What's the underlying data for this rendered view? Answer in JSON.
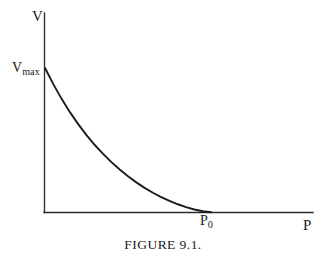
{
  "figure": {
    "caption": "FIGURE 9.1.",
    "background_color": "#ffffff",
    "ink_color": "#1a1a1a"
  },
  "axes": {
    "y_axis_label": "V",
    "x_axis_label": "P",
    "y_axis_tick_label_base": "V",
    "y_axis_tick_label_sub": "max",
    "x_axis_tick_label_base": "P",
    "x_axis_tick_label_sub": "0"
  },
  "chart_data": {
    "type": "line",
    "title": "FIGURE 9.1.",
    "xlabel": "P",
    "ylabel": "V",
    "grid": false,
    "legend": null,
    "annotations": [
      {
        "name": "y-intercept",
        "label": "V max",
        "x": 0,
        "y": 1.0
      },
      {
        "name": "x-intercept",
        "label": "P 0",
        "x": 1.0,
        "y": 0
      }
    ],
    "xlim": [
      0,
      1.62
    ],
    "ylim": [
      0,
      1.38
    ],
    "xticks": [
      {
        "value": 1.0,
        "label": "P0"
      }
    ],
    "yticks": [
      {
        "value": 1.0,
        "label": "Vmax"
      }
    ],
    "series": [
      {
        "name": "velocity-pressure curve",
        "description": "convex decreasing curve from Vmax at P=0 to zero at P=P0",
        "x": [
          0.0,
          0.05,
          0.1,
          0.15,
          0.2,
          0.25,
          0.3,
          0.35,
          0.4,
          0.45,
          0.5,
          0.55,
          0.6,
          0.65,
          0.7,
          0.75,
          0.8,
          0.85,
          0.9,
          0.95,
          1.0
        ],
        "y": [
          1.0,
          0.888,
          0.786,
          0.694,
          0.611,
          0.535,
          0.466,
          0.404,
          0.347,
          0.296,
          0.249,
          0.207,
          0.169,
          0.135,
          0.105,
          0.078,
          0.055,
          0.035,
          0.019,
          0.007,
          0.0
        ]
      }
    ]
  }
}
